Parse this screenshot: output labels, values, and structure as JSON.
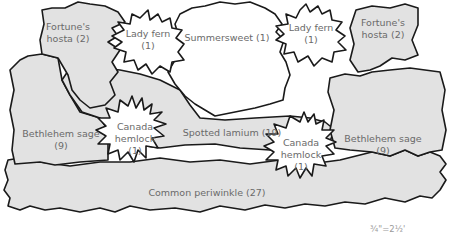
{
  "diagram": {
    "type": "garden-planting-plan",
    "scale_label": "¾\"=2½'",
    "colors": {
      "bed_fill": "#e2e2e2",
      "feature_fill": "#ffffff",
      "outline": "#1a1a1a",
      "label_text": "#6a6a6a"
    },
    "plants": [
      {
        "id": "fortunes-hosta-left",
        "name": "Fortune's",
        "name2": "hosta (2)"
      },
      {
        "id": "lady-fern-left",
        "name": "Lady fern",
        "count": "(1)"
      },
      {
        "id": "summersweet",
        "name": "Summersweet (1)"
      },
      {
        "id": "lady-fern-right",
        "name": "Lady fern",
        "count": "(1)"
      },
      {
        "id": "fortunes-hosta-right",
        "name": "Fortune's",
        "name2": "hosta (2)"
      },
      {
        "id": "bethlehem-sage-left",
        "name": "Bethlehem sage",
        "count": "(9)"
      },
      {
        "id": "canada-hemlock-left",
        "name": "Canada",
        "name2": "hemlock",
        "count": "(1)"
      },
      {
        "id": "spotted-lamium",
        "name": "Spotted lamium (19)"
      },
      {
        "id": "canada-hemlock-right",
        "name": "Canada",
        "name2": "hemlock",
        "count": "(1)"
      },
      {
        "id": "bethlehem-sage-right",
        "name": "Bethlehem sage",
        "count": "(9)"
      },
      {
        "id": "common-periwinkle",
        "name": "Common periwinkle (27)"
      }
    ]
  }
}
